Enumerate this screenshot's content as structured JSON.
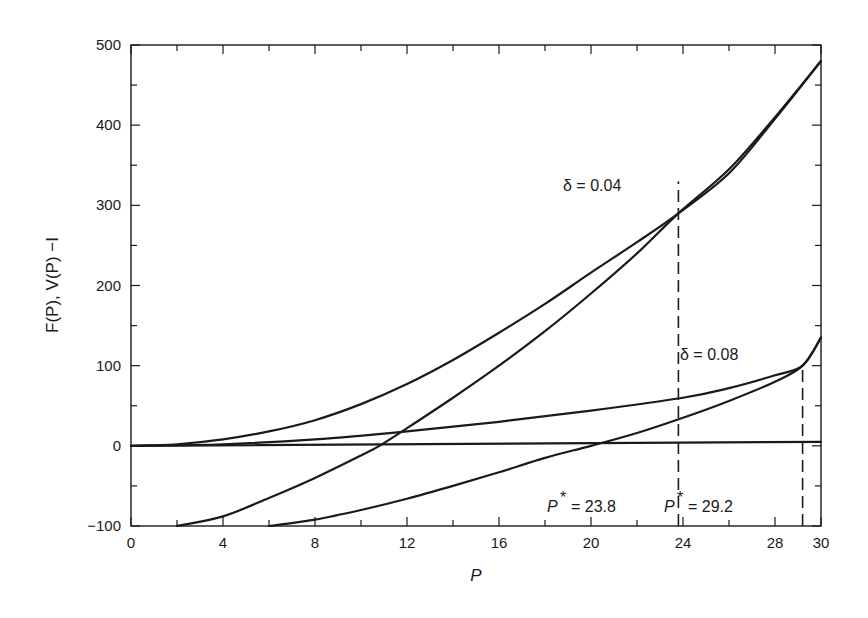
{
  "chart_data": {
    "type": "line",
    "title": "",
    "xlabel": "P",
    "ylabel": "F(P), V(P) −I",
    "xlim": [
      0,
      30
    ],
    "ylim": [
      -100,
      500
    ],
    "grid": false,
    "legend": null,
    "x_ticks": [
      0,
      4,
      8,
      12,
      16,
      20,
      24,
      28,
      30
    ],
    "x_tick_labels": [
      "0",
      "4",
      "8",
      "12",
      "16",
      "20",
      "24",
      "28",
      "30"
    ],
    "y_ticks": [
      -100,
      0,
      100,
      200,
      300,
      400,
      500
    ],
    "y_tick_labels": [
      "−100",
      "0",
      "100",
      "200",
      "300",
      "400",
      "500"
    ],
    "series": [
      {
        "name": "F(P), δ = 0.04",
        "style": "solid",
        "x": [
          0,
          2,
          4,
          6,
          8,
          10,
          12,
          14,
          16,
          18,
          20,
          22,
          23.8,
          26,
          28,
          30
        ],
        "y": [
          0,
          2,
          8,
          18,
          32,
          52,
          77,
          107,
          141,
          177,
          216,
          254,
          290,
          340,
          408,
          480
        ]
      },
      {
        "name": "V(P) − I, δ = 0.04",
        "style": "solid",
        "x": [
          2,
          4,
          6,
          8,
          10,
          10.8,
          12,
          14,
          16,
          18,
          20,
          22,
          23.8,
          26,
          28,
          30
        ],
        "y": [
          -100,
          -88,
          -65,
          -40,
          -12,
          0,
          22,
          60,
          100,
          143,
          190,
          240,
          290,
          345,
          410,
          480
        ]
      },
      {
        "name": "F(P), δ = 0.08",
        "style": "solid",
        "x": [
          0,
          4,
          8,
          12,
          16,
          20,
          24,
          26,
          28,
          29.2,
          30
        ],
        "y": [
          0,
          2,
          8,
          18,
          30,
          44,
          60,
          72,
          88,
          100,
          135
        ]
      },
      {
        "name": "V(P) − I, δ = 0.08",
        "style": "solid",
        "x": [
          6,
          8,
          10,
          12,
          14,
          16,
          18,
          20,
          22,
          24,
          26,
          28,
          29.2,
          30
        ],
        "y": [
          -100,
          -92,
          -80,
          -66,
          -50,
          -33,
          -15,
          0,
          16,
          35,
          56,
          80,
          100,
          135
        ]
      },
      {
        "name": "zero line",
        "style": "solid",
        "x": [
          0,
          30
        ],
        "y": [
          0,
          5
        ]
      }
    ],
    "vlines": [
      {
        "x": 23.8,
        "y_from": -100,
        "y_to": 330,
        "style": "dashed"
      },
      {
        "x": 29.2,
        "y_from": -100,
        "y_to": 100,
        "style": "dashed"
      }
    ],
    "annotations": [
      {
        "text": "δ = 0.04",
        "x": 20.5,
        "y": 290
      },
      {
        "text": "δ = 0.08",
        "x": 24,
        "y": 115
      },
      {
        "text": "P* = 23.8",
        "x": 17,
        "y": -90
      },
      {
        "text": "P* = 29.2",
        "x": 24.5,
        "y": -90
      }
    ]
  },
  "labels": {
    "xlabel": "P",
    "ylabel": "F(P), V(P) −I",
    "delta1": "δ = 0.04",
    "delta2": "δ = 0.08",
    "pstar1_value": "= 23.8",
    "pstar2_value": "= 29.2",
    "pstar_symbol": "P",
    "pstar_star": "*"
  }
}
